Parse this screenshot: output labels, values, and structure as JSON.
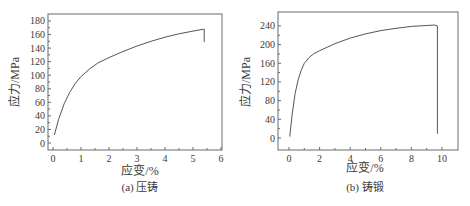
{
  "chart_data": [
    {
      "type": "line",
      "panel": "a",
      "caption": "(a) 压铸",
      "title": "",
      "xlabel": "应变/%",
      "ylabel": "应力/MPa",
      "xlim": [
        -0.2,
        6
      ],
      "ylim": [
        -10,
        190
      ],
      "xticks": [
        0,
        1,
        2,
        3,
        4,
        5,
        6
      ],
      "yticks": [
        0,
        20,
        40,
        60,
        80,
        100,
        120,
        140,
        160,
        180
      ],
      "grid": false,
      "legend": null,
      "series": [
        {
          "name": "压铸",
          "color": "#555555",
          "x": [
            0.05,
            0.2,
            0.4,
            0.6,
            0.8,
            1.0,
            1.3,
            1.6,
            2.0,
            2.5,
            3.0,
            3.5,
            4.0,
            4.5,
            5.0,
            5.4,
            5.4
          ],
          "y": [
            12,
            35,
            58,
            75,
            88,
            98,
            109,
            118,
            126,
            135,
            143,
            150,
            156,
            161,
            165,
            168,
            149
          ]
        }
      ]
    },
    {
      "type": "line",
      "panel": "b",
      "caption": "(b) 铸锻",
      "title": "",
      "xlabel": "应变/%",
      "ylabel": "应力/MPa",
      "xlim": [
        -0.7,
        11
      ],
      "ylim": [
        -25,
        270
      ],
      "xticks": [
        0,
        2,
        4,
        6,
        8,
        10
      ],
      "yticks": [
        0,
        40,
        80,
        120,
        160,
        200,
        240
      ],
      "grid": false,
      "legend": null,
      "series": [
        {
          "name": "铸锻",
          "color": "#555555",
          "x": [
            0.05,
            0.2,
            0.4,
            0.6,
            0.8,
            1.0,
            1.3,
            1.6,
            2.0,
            3.0,
            4.0,
            5.0,
            6.0,
            7.0,
            8.0,
            9.0,
            9.5,
            9.7,
            9.7,
            9.75
          ],
          "y": [
            3,
            50,
            95,
            125,
            145,
            160,
            172,
            180,
            187,
            202,
            214,
            223,
            230,
            235,
            239,
            241,
            242,
            240,
            10,
            10
          ]
        }
      ]
    }
  ],
  "panels": {
    "a": {
      "ylabel": "应力/MPa",
      "xlabel": "应变/%",
      "caption": "(a) 压铸",
      "yticks": [
        "0",
        "20",
        "40",
        "60",
        "80",
        "100",
        "120",
        "140",
        "160",
        "180"
      ],
      "xticks": [
        "0",
        "1",
        "2",
        "3",
        "4",
        "5",
        "6"
      ]
    },
    "b": {
      "ylabel": "应力/MPa",
      "xlabel": "应变/%",
      "caption": "(b) 铸锻",
      "yticks": [
        "0",
        "40",
        "80",
        "120",
        "160",
        "200",
        "240"
      ],
      "xticks": [
        "0",
        "2",
        "4",
        "6",
        "8",
        "10"
      ]
    }
  },
  "colors": {
    "frame": "#6a6a6a",
    "curve": "#555555",
    "text": "#3a3a3a"
  }
}
